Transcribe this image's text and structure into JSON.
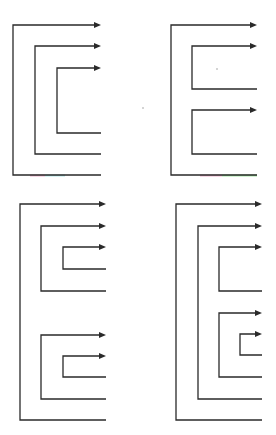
{
  "diagram": {
    "title": "",
    "colors": {
      "line": "#2a2a2a",
      "background": "#ffffff",
      "artifact_pink": "#e8a0c0",
      "artifact_green": "#90e090",
      "artifact_cyan": "#a0e0e0"
    },
    "panels": [
      {
        "id": "top-left",
        "end_x": 101,
        "brackets": [
          {
            "x": 13,
            "top": 25,
            "bottom": 175
          },
          {
            "x": 35,
            "top": 46,
            "bottom": 154
          },
          {
            "x": 57,
            "top": 68,
            "bottom": 133
          }
        ],
        "artifacts": [
          {
            "x1": 30,
            "x2": 45,
            "y": 175,
            "color": "#e8a0c0"
          },
          {
            "x1": 45,
            "x2": 65,
            "y": 175,
            "color": "#a0e0e0"
          }
        ]
      },
      {
        "id": "top-right",
        "end_x": 257,
        "brackets": [
          {
            "x": 171,
            "top": 25,
            "bottom": 175
          },
          {
            "x": 192,
            "top": 46,
            "bottom": 89
          },
          {
            "x": 192,
            "top": 110,
            "bottom": 154
          }
        ],
        "artifacts": [
          {
            "x1": 200,
            "x2": 222,
            "y": 175,
            "color": "#e8a0c0"
          },
          {
            "x1": 222,
            "x2": 257,
            "y": 175,
            "color": "#90e090"
          }
        ],
        "dots": [
          {
            "x": 217,
            "y": 69
          },
          {
            "x": 143,
            "y": 108
          }
        ]
      },
      {
        "id": "bottom-left",
        "end_x": 106,
        "brackets": [
          {
            "x": 20,
            "top": 204,
            "bottom": 420
          },
          {
            "x": 41,
            "top": 226,
            "bottom": 291
          },
          {
            "x": 63,
            "top": 247,
            "bottom": 269
          },
          {
            "x": 41,
            "top": 335,
            "bottom": 399
          },
          {
            "x": 63,
            "top": 356,
            "bottom": 377
          }
        ],
        "artifacts": []
      },
      {
        "id": "bottom-right",
        "end_x": 262,
        "brackets": [
          {
            "x": 176,
            "top": 204,
            "bottom": 420
          },
          {
            "x": 198,
            "top": 226,
            "bottom": 399
          },
          {
            "x": 219,
            "top": 247,
            "bottom": 291
          },
          {
            "x": 219,
            "top": 313,
            "bottom": 377
          },
          {
            "x": 240,
            "top": 334,
            "bottom": 355
          }
        ],
        "artifacts": []
      }
    ]
  }
}
